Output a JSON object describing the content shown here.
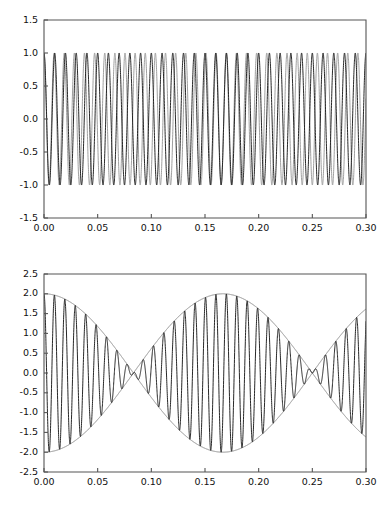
{
  "figure": {
    "background": "#ffffff",
    "width": 386,
    "height": 508,
    "panel_count": 2
  },
  "colors": {
    "axis": "#555555",
    "tick_text": "#111111",
    "series_primary": "#1c1c1c",
    "series_secondary": "#9a9a9a",
    "envelope": "#8c8c8c",
    "background": "#ffffff"
  },
  "chart_data": [
    {
      "id": "top-panel",
      "type": "line",
      "title": "",
      "subtitle": "",
      "xlabel": "",
      "ylabel": "",
      "xlim": [
        0.0,
        0.3
      ],
      "ylim": [
        -1.5,
        1.5
      ],
      "grid": false,
      "legend": null,
      "frame": "box",
      "xticks": [
        0.0,
        0.05,
        0.1,
        0.15,
        0.2,
        0.25,
        0.3
      ],
      "xticklabels": [
        "0.00",
        "0.05",
        "0.10",
        "0.15",
        "0.20",
        "0.25",
        "0.30"
      ],
      "yticks": [
        -1.5,
        -1.0,
        -0.5,
        0.0,
        0.5,
        1.0,
        1.5
      ],
      "yticklabels": [
        "-1.5",
        "-1.0",
        "-0.5",
        "0.0",
        "0.5",
        "1.0",
        "1.5"
      ],
      "series": [
        {
          "name": "tone-1",
          "color": "#1c1c1c",
          "form": "cosine",
          "amplitude": 1.0,
          "frequency_hz": 100.0,
          "phase_rad": 0.0,
          "offset": 0.0
        },
        {
          "name": "tone-2",
          "color": "#9a9a9a",
          "form": "cosine",
          "amplitude": 1.0,
          "frequency_hz": 106.0,
          "phase_rad": 0.0,
          "offset": 0.0
        }
      ],
      "samples": 4000,
      "annotations": []
    },
    {
      "id": "bottom-panel",
      "type": "line",
      "title": "",
      "subtitle": "",
      "xlabel": "",
      "ylabel": "",
      "xlim": [
        0.0,
        0.3
      ],
      "ylim": [
        -2.5,
        2.5
      ],
      "grid": false,
      "legend": null,
      "frame": "box",
      "xticks": [
        0.0,
        0.05,
        0.1,
        0.15,
        0.2,
        0.25,
        0.3
      ],
      "xticklabels": [
        "0.00",
        "0.05",
        "0.10",
        "0.15",
        "0.20",
        "0.25",
        "0.30"
      ],
      "yticks": [
        -2.5,
        -2.0,
        -1.5,
        -1.0,
        -0.5,
        0.0,
        0.5,
        1.0,
        1.5,
        2.0,
        2.5
      ],
      "yticklabels": [
        "-2.5",
        "-2.0",
        "-1.5",
        "-1.0",
        "-0.5",
        "0.0",
        "0.5",
        "1.0",
        "1.5",
        "2.0",
        "2.5"
      ],
      "series": [
        {
          "name": "sum-of-tones",
          "color": "#1c1c1c",
          "form": "sum-cosine",
          "amplitude": 1.0,
          "components_hz": [
            100.0,
            106.0
          ],
          "peak_amplitude": 2.0,
          "beat_frequency_hz": 6.0,
          "beat_nodes_x": [
            0.0833,
            0.25
          ],
          "beat_antinodes_x": [
            0.0,
            0.1667,
            0.3333
          ]
        },
        {
          "name": "beat-envelope",
          "color": "#8c8c8c",
          "form": "envelope-cosine",
          "amplitude": 2.0,
          "frequency_hz": 3.0,
          "phase_rad": 0.0
        }
      ],
      "samples": 4000,
      "annotations": []
    }
  ]
}
